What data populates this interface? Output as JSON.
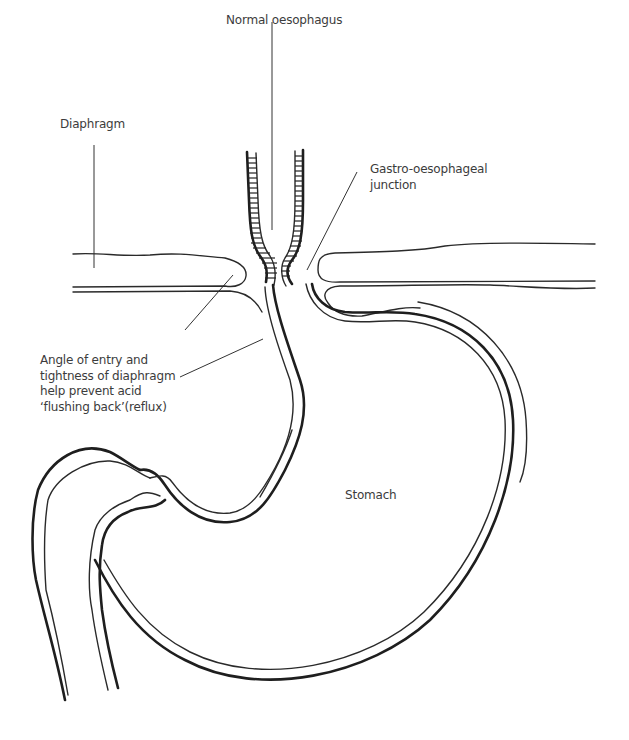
{
  "diagram": {
    "labels": {
      "oesophagus": "Normal oesophagus",
      "diaphragm": "Diaphragm",
      "ge_junction": "Gastro-oesophageal\njunction",
      "angle_note": "Angle of entry and\ntightness of diaphragm\nhelp prevent acid\n‘flushing back’(reflux)",
      "stomach": "Stomach"
    },
    "colors": {
      "stroke": "#1e1e1e",
      "text": "#3c3c3c",
      "background": "#ffffff"
    }
  }
}
